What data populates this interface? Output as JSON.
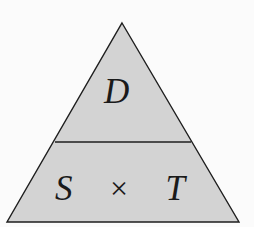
{
  "diagram": {
    "type": "formula-triangle",
    "top_section": {
      "label": "D"
    },
    "bottom_section": {
      "left_label": "S",
      "operator": "×",
      "right_label": "T"
    },
    "colors": {
      "fill": "#d3d3d3",
      "stroke": "#1e1e1e",
      "text": "#1a1a1a",
      "background": "#fbfbfb"
    }
  }
}
